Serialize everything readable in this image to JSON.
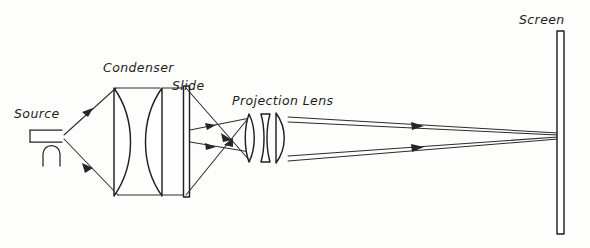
{
  "figure": {
    "background_color": "#fdfdfc",
    "ink_color": "#25262a",
    "width": 590,
    "height": 248
  },
  "labels": {
    "source": "Source",
    "condenser": "Condenser",
    "slide": "Slide",
    "projection_lens": "Projection Lens",
    "screen": "Screen"
  },
  "components": {
    "source": {
      "name": "Source",
      "symbol": "lamp-bracket-with-arc",
      "x": 44,
      "y": 136
    },
    "condenser": {
      "name": "Condenser",
      "type": "two plano-convex lenses",
      "element_count": 2,
      "x_left": 113,
      "x_right": 163,
      "top": 87,
      "bottom": 196
    },
    "slide": {
      "name": "Slide",
      "type": "thin flat plate",
      "x": 187,
      "top": 86,
      "bottom": 197
    },
    "projection_lens": {
      "name": "Projection Lens",
      "type": "three-element compound lens",
      "element_count": 3,
      "x_left": 246,
      "x_right": 285,
      "top": 113,
      "bottom": 163
    },
    "screen": {
      "name": "Screen",
      "type": "flat vertical screen",
      "x": 561,
      "top": 31,
      "bottom": 234
    }
  },
  "rays": {
    "source_to_condenser": 2,
    "condenser_to_slide": 2,
    "slide_to_projection_lens": 4,
    "projection_lens_to_screen": 2,
    "arrow_count": 8
  }
}
